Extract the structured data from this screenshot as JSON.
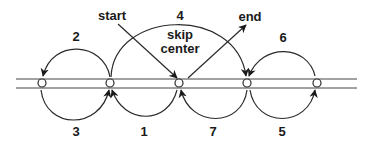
{
  "diagram": {
    "labels": {
      "start": "start",
      "end": "end",
      "skip_line1": "skip",
      "skip_line2": "center"
    },
    "steps": [
      {
        "number": "1",
        "from": "node-3",
        "to": "node-2",
        "side": "below"
      },
      {
        "number": "2",
        "from": "node-2",
        "to": "node-1",
        "side": "above"
      },
      {
        "number": "3",
        "from": "node-1",
        "to": "node-2",
        "side": "below"
      },
      {
        "number": "4",
        "from": "node-2",
        "to": "node-4",
        "side": "above",
        "note": "skip center"
      },
      {
        "number": "5",
        "from": "node-4",
        "to": "node-5",
        "side": "below"
      },
      {
        "number": "6",
        "from": "node-5",
        "to": "node-4",
        "side": "above"
      },
      {
        "number": "7",
        "from": "node-4",
        "to": "node-3",
        "side": "below"
      }
    ],
    "nodes": [
      "node-1",
      "node-2",
      "node-3",
      "node-4",
      "node-5"
    ],
    "colors": {
      "stroke": "#2a2a2a",
      "background": "#ffffff"
    }
  }
}
